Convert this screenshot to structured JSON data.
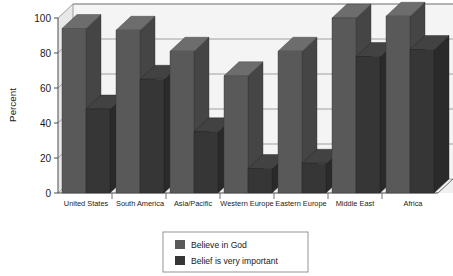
{
  "chart_data": {
    "type": "bar",
    "title": "",
    "subtitle": "",
    "xlabel": "",
    "ylabel": "Percent",
    "ylim": [
      0,
      100
    ],
    "yticks": [
      0,
      20,
      40,
      60,
      80,
      100
    ],
    "ytick_labels": [
      "0",
      "20",
      "40",
      "60",
      "80",
      "100"
    ],
    "grid": true,
    "grid_axis": "y",
    "legend_position": "bottom-center",
    "style": "3d-clustered-column",
    "categories": [
      "United States",
      "South America",
      "Asia/Pacific",
      "Western Europe",
      "Eastern Europe",
      "Middle East",
      "Africa"
    ],
    "series": [
      {
        "name": "Believe in God",
        "color": "#595959",
        "values": [
          94,
          93,
          81,
          67,
          81,
          100,
          101
        ]
      },
      {
        "name": "Belief is very important",
        "color": "#363636",
        "values": [
          48,
          65,
          35,
          14,
          17,
          78,
          82
        ]
      }
    ],
    "legend": [
      {
        "label": "Believe in God",
        "color": "#595959"
      },
      {
        "label": "Belief is very important",
        "color": "#363636"
      }
    ]
  },
  "axes": {
    "y_axis_title": "Percent",
    "y_tick_0": "0",
    "y_tick_20": "20",
    "y_tick_40": "40",
    "y_tick_60": "60",
    "y_tick_80": "80",
    "y_tick_100": "100"
  },
  "category_labels": {
    "c0": "United States",
    "c1": "South America",
    "c2": "Asia/Pacific",
    "c3": "Western Europe",
    "c4": "Eastern Europe",
    "c5": "Middle East",
    "c6": "Africa"
  },
  "legend": {
    "item0_label": "Believe in God",
    "item1_label": "Belief is very important"
  },
  "colors": {
    "series1": "#595959",
    "series2": "#363636",
    "series1_side": "#4a4a4a",
    "series1_top": "#6b6b6b",
    "series2_side": "#2a2a2a",
    "series2_top": "#474747",
    "plot_background": "#f2f2f2",
    "plot_wall": "#eaeaea",
    "grid": "#808080",
    "axis": "#4d4d4d",
    "legend_border": "#808080",
    "page_background": "#ffffff"
  }
}
